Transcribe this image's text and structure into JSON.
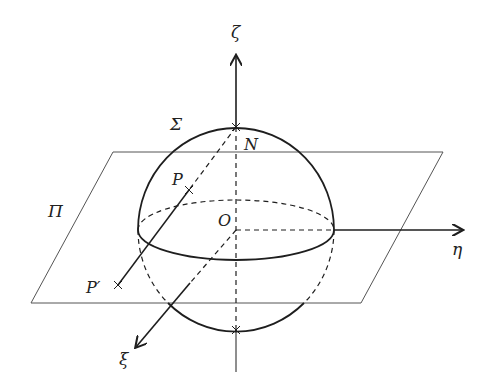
{
  "figure": {
    "labels": {
      "zeta": "ζ",
      "eta": "η",
      "xi": "ξ",
      "sigma": "Σ",
      "pi": "Π",
      "north": "N",
      "origin": "O",
      "point_p": "P",
      "point_p_prime": "P′"
    },
    "colors": {
      "stroke": "#1e1e1e",
      "plane": "#555555",
      "background": "#ffffff"
    }
  }
}
